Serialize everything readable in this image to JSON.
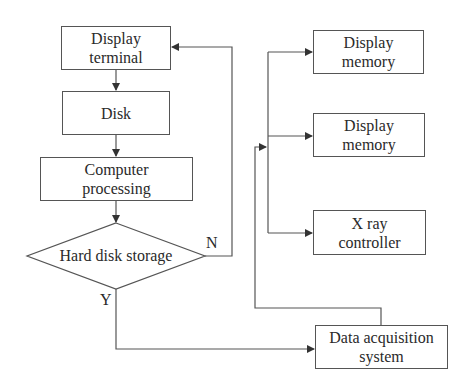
{
  "diagram": {
    "nodes": {
      "display_terminal": {
        "line1": "Display",
        "line2": "terminal"
      },
      "disk": {
        "line1": "Disk"
      },
      "computer_processing": {
        "line1": "Computer",
        "line2": "processing"
      },
      "hard_disk_storage": {
        "label": "Hard disk storage"
      },
      "display_memory_1": {
        "line1": "Display",
        "line2": "memory"
      },
      "display_memory_2": {
        "line1": "Display",
        "line2": "memory"
      },
      "xray_controller": {
        "line1": "X ray",
        "line2": "controller"
      },
      "data_acquisition": {
        "line1": "Data acquisition",
        "line2": "system"
      }
    },
    "branch_labels": {
      "no": "N",
      "yes": "Y"
    },
    "edges": [
      {
        "from": "display_terminal",
        "to": "disk"
      },
      {
        "from": "disk",
        "to": "computer_processing"
      },
      {
        "from": "computer_processing",
        "to": "hard_disk_storage"
      },
      {
        "from": "hard_disk_storage",
        "to": "display_terminal",
        "label": "N"
      },
      {
        "from": "hard_disk_storage",
        "to": "data_acquisition",
        "label": "Y"
      },
      {
        "from": "data_acquisition",
        "to": "bus"
      },
      {
        "from": "bus",
        "to": "display_memory_1"
      },
      {
        "from": "bus",
        "to": "display_memory_2"
      },
      {
        "from": "bus",
        "to": "xray_controller"
      }
    ],
    "colors": {
      "line": "#555555",
      "text": "#2a2a2a",
      "background": "#ffffff"
    }
  }
}
